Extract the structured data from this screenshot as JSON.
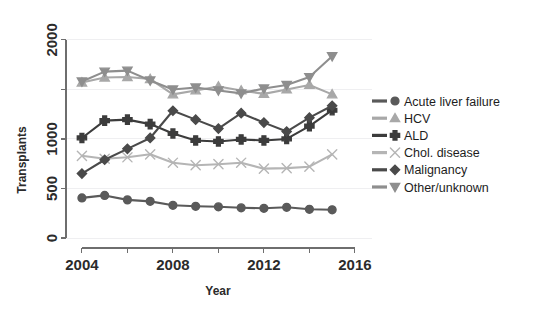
{
  "chart_data": {
    "type": "line",
    "title": "",
    "xlabel": "Year",
    "ylabel": "Transplants",
    "xlim": [
      2003.3,
      2016.4
    ],
    "ylim": [
      0,
      2100
    ],
    "x_ticks_major": [
      2004,
      2008,
      2012,
      2016
    ],
    "x_ticks_minor": [
      2006,
      2010,
      2014
    ],
    "y_ticks_major": [
      0,
      500,
      1000,
      2000
    ],
    "y_ticks_minor": [
      1500
    ],
    "grid": true,
    "legend_position": "right",
    "x": [
      2004,
      2005,
      2006,
      2007,
      2008,
      2009,
      2010,
      2011,
      2012,
      2013,
      2014,
      2015
    ],
    "series": [
      {
        "name": "Acute liver failure",
        "marker": "circle",
        "color": "#5a5a5a",
        "values": [
          405,
          430,
          385,
          370,
          330,
          320,
          315,
          305,
          300,
          310,
          290,
          285
        ]
      },
      {
        "name": "HCV",
        "marker": "triangle-up",
        "color": "#a8a8a8",
        "values": [
          1570,
          1620,
          1625,
          1605,
          1450,
          1490,
          1530,
          1490,
          1455,
          1500,
          1545,
          1450
        ]
      },
      {
        "name": "ALD",
        "marker": "plus",
        "color": "#3c3c3c",
        "values": [
          1010,
          1185,
          1195,
          1150,
          1055,
          985,
          975,
          995,
          985,
          1000,
          1130,
          1290
        ]
      },
      {
        "name": "Chol. disease",
        "marker": "x",
        "color": "#b5b5b5",
        "values": [
          830,
          800,
          815,
          845,
          760,
          735,
          745,
          760,
          700,
          705,
          720,
          845
        ]
      },
      {
        "name": "Malignancy",
        "marker": "diamond",
        "color": "#4a4a4a",
        "values": [
          650,
          790,
          900,
          1010,
          1285,
          1195,
          1105,
          1260,
          1165,
          1075,
          1215,
          1335
        ]
      },
      {
        "name": "Other/unknown",
        "marker": "triangle-down",
        "color": "#8e8e8e",
        "values": [
          1580,
          1680,
          1690,
          1590,
          1500,
          1520,
          1490,
          1460,
          1510,
          1545,
          1625,
          1835
        ]
      }
    ]
  },
  "legend": {
    "items": [
      {
        "label": "Acute liver failure"
      },
      {
        "label": "HCV"
      },
      {
        "label": "ALD"
      },
      {
        "label": "Chol. disease"
      },
      {
        "label": "Malignancy"
      },
      {
        "label": "Other/unknown"
      }
    ]
  }
}
